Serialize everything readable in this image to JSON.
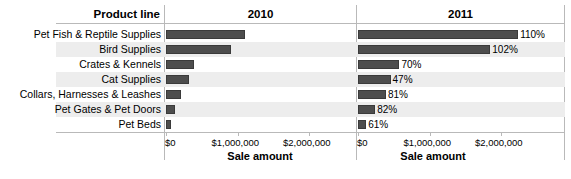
{
  "header": {
    "row_header_label": "Product line",
    "columns": [
      {
        "label": "2010"
      },
      {
        "label": "2011"
      }
    ]
  },
  "axis": {
    "title": "Sale amount",
    "tick_labels": [
      "$0",
      "$1,000,000",
      "$2,000,000"
    ],
    "tick_values": [
      0,
      1000000,
      2000000
    ],
    "min": 0,
    "max": 2200000
  },
  "colors": {
    "bar": "#4d4d4d",
    "bar_border": "#3a3a3a",
    "band": "#ededed",
    "rule": "#b9b9b9",
    "text": "#000000",
    "background": "#ffffff"
  },
  "chart_data": {
    "type": "bar",
    "title": "",
    "xlabel": "Sale amount",
    "ylabel": "Product line",
    "xlim": [
      0,
      2200000
    ],
    "grid": false,
    "legend": "none",
    "orientation": "horizontal",
    "panels": [
      "2010",
      "2011"
    ],
    "categories": [
      "Pet Fish & Reptile Supplies",
      "Bird Supplies",
      "Crates & Kennels",
      "Cat Supplies",
      "Collars, Harnesses & Leashes",
      "Pet Gates & Pet Doors",
      "Pet Beds"
    ],
    "series": [
      {
        "name": "2010",
        "values": [
          1100000,
          915000,
          390000,
          315000,
          215000,
          130000,
          70000
        ],
        "labels": [
          "",
          "",
          "",
          "",
          "",
          "",
          ""
        ]
      },
      {
        "name": "2011",
        "values": [
          2240000,
          1850000,
          580000,
          455000,
          390000,
          240000,
          115000
        ],
        "labels": [
          "110%",
          "102%",
          "70%",
          "47%",
          "81%",
          "82%",
          "61%"
        ]
      }
    ]
  }
}
